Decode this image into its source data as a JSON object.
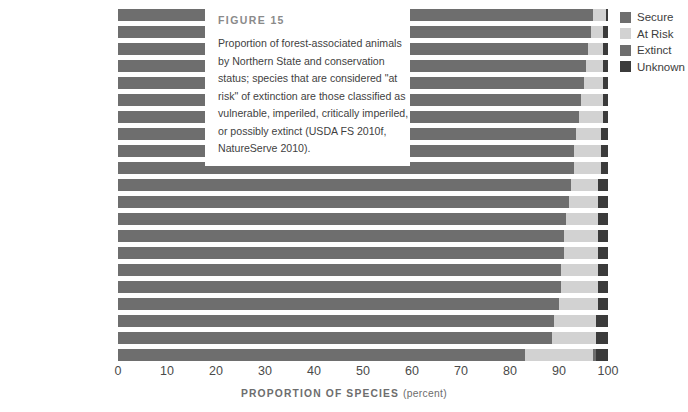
{
  "figure": {
    "label": "FIGURE 15",
    "caption": "Proportion of forest-associated animals by Northern State and conservation status; species that are considered \"at risk\" of extinction are those classified as vulnerable, imperiled, critically imperiled, or possibly extinct (USDA FS 2010f, NatureServe 2010)."
  },
  "legend": {
    "position": "right",
    "items": [
      {
        "label": "Secure",
        "color": "#6e6e6e"
      },
      {
        "label": "At Risk",
        "color": "#d2d2d2"
      },
      {
        "label": "Extinct",
        "color": "#6e6e6e"
      },
      {
        "label": "Unknown",
        "color": "#3b3b3b"
      }
    ]
  },
  "axis": {
    "title": "PROPORTION OF SPECIES",
    "unit": "(percent)",
    "ticks": [
      0,
      10,
      20,
      30,
      40,
      50,
      60,
      70,
      80,
      90,
      100
    ]
  },
  "chart_data": {
    "type": "bar",
    "orientation": "horizontal",
    "stacked": true,
    "title": "FIGURE 15",
    "xlabel": "PROPORTION OF SPECIES (percent)",
    "ylabel": "",
    "xlim": [
      0,
      100
    ],
    "grid": false,
    "legend_position": "right",
    "categories": [
      "Vermont",
      "Iowa",
      "Rhode Island",
      "Minnesota",
      "Delaware",
      "Wisconsin",
      "Maryland",
      "West Virginia",
      "New Hampshire",
      "Maine",
      "Michigan",
      "Missouri",
      "Ohio",
      "Illinois",
      "Connecticut",
      "Massachusetts",
      "Indiana",
      "Pennsylvania",
      "New York",
      "New Jersey",
      "All North"
    ],
    "series": [
      {
        "name": "Secure",
        "color": "#6e6e6e",
        "values": [
          97.0,
          96.5,
          96.0,
          95.5,
          95.0,
          94.5,
          94.0,
          93.5,
          93.0,
          93.0,
          92.5,
          92.0,
          91.5,
          91.0,
          91.0,
          90.5,
          90.5,
          90.0,
          89.0,
          88.5,
          83.0
        ]
      },
      {
        "name": "At Risk",
        "color": "#d2d2d2",
        "values": [
          2.5,
          2.5,
          3.0,
          3.5,
          4.0,
          4.5,
          5.0,
          5.0,
          5.5,
          5.5,
          5.5,
          6.0,
          6.5,
          7.0,
          7.0,
          7.5,
          7.5,
          8.0,
          8.5,
          9.0,
          14.0
        ]
      },
      {
        "name": "Extinct",
        "color": "#6e6e6e",
        "values": [
          0.0,
          0.0,
          0.0,
          0.0,
          0.0,
          0.0,
          0.0,
          0.0,
          0.0,
          0.0,
          0.0,
          0.0,
          0.0,
          0.0,
          0.0,
          0.0,
          0.0,
          0.0,
          0.0,
          0.0,
          0.5
        ]
      },
      {
        "name": "Unknown",
        "color": "#3b3b3b",
        "values": [
          0.5,
          1.0,
          1.0,
          1.0,
          1.0,
          1.0,
          1.0,
          1.5,
          1.5,
          1.5,
          2.0,
          2.0,
          2.0,
          2.0,
          2.0,
          2.0,
          2.0,
          2.0,
          2.5,
          2.5,
          2.5
        ]
      }
    ]
  }
}
